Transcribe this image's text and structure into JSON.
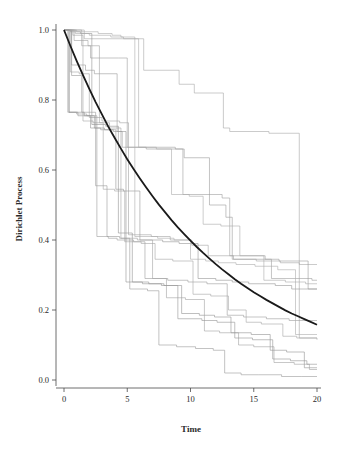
{
  "chart_data": {
    "type": "line",
    "title": "",
    "subtitle": "",
    "xlabel": "Time",
    "ylabel": "Dirichlet Process",
    "xlim": [
      0,
      20
    ],
    "ylim": [
      0.0,
      1.0
    ],
    "xticks": [
      0,
      5,
      10,
      15,
      20
    ],
    "xticklabels": [
      "0",
      "5",
      "10",
      "15",
      "20"
    ],
    "yticks": [
      0.0,
      0.2,
      0.4,
      0.6,
      0.8,
      1.0
    ],
    "yticklabels": [
      "0.0",
      "0.2",
      "0.4",
      "0.6",
      "0.8",
      "1.0"
    ],
    "grid": false,
    "legend": "none",
    "baseline_color": "#1a1a1a",
    "path_color": "#9a9a9a",
    "series": [
      {
        "name": "baseline-exponential",
        "kind": "smooth",
        "color": "#1a1a1a",
        "width": 1.8,
        "x": [
          0,
          0.5,
          1,
          1.5,
          2,
          2.5,
          3,
          3.5,
          4,
          4.5,
          5,
          5.5,
          6,
          6.5,
          7,
          7.5,
          8,
          8.5,
          9,
          9.5,
          10,
          10.5,
          11,
          11.5,
          12,
          12.5,
          13,
          13.5,
          14,
          14.5,
          15,
          15.5,
          16,
          16.5,
          17,
          17.5,
          18,
          18.5,
          19,
          19.5,
          20
        ],
        "values": [
          1.0,
          0.955,
          0.912,
          0.871,
          0.832,
          0.794,
          0.759,
          0.724,
          0.692,
          0.661,
          0.631,
          0.603,
          0.576,
          0.55,
          0.525,
          0.501,
          0.479,
          0.457,
          0.436,
          0.417,
          0.398,
          0.38,
          0.363,
          0.347,
          0.331,
          0.316,
          0.302,
          0.288,
          0.275,
          0.263,
          0.251,
          0.24,
          0.229,
          0.219,
          0.209,
          0.199,
          0.19,
          0.182,
          0.174,
          0.166,
          0.158
        ]
      },
      {
        "name": "path-1",
        "kind": "step",
        "color": "#a8a8a8",
        "x": [
          0,
          0.9,
          1.6,
          4.6,
          6.3,
          9.1,
          10.3,
          12.6,
          13.1,
          16.2,
          18.6,
          20
        ],
        "values": [
          1.0,
          1.0,
          0.975,
          0.975,
          0.885,
          0.845,
          0.82,
          0.72,
          0.71,
          0.705,
          0.33,
          0.33
        ]
      },
      {
        "name": "path-2",
        "kind": "step",
        "color": "#a0a0a0",
        "x": [
          0,
          1.4,
          2.1,
          4.3,
          5.0,
          8.8,
          9.4,
          12.5,
          13.1,
          15.9,
          16.4,
          19.6,
          20
        ],
        "values": [
          1.0,
          0.955,
          0.92,
          0.92,
          0.665,
          0.66,
          0.53,
          0.52,
          0.355,
          0.345,
          0.29,
          0.285,
          0.285
        ]
      },
      {
        "name": "path-3",
        "kind": "step",
        "color": "#9c9c9c",
        "x": [
          0,
          0.6,
          1.7,
          2.4,
          4.2,
          4.6,
          6.5,
          9.5,
          11.5,
          12.8,
          13.3,
          17.0,
          19.3,
          20
        ],
        "values": [
          1.0,
          0.9,
          0.885,
          0.875,
          0.71,
          0.665,
          0.66,
          0.635,
          0.5,
          0.465,
          0.345,
          0.34,
          0.26,
          0.26
        ]
      },
      {
        "name": "path-4",
        "kind": "step",
        "color": "#a4a4a4",
        "x": [
          0,
          0.5,
          1.2,
          2.0,
          3.0,
          4.4,
          5.1,
          6.9,
          8.4,
          10.1,
          11.4,
          13.4,
          15.2,
          17.1,
          18.6,
          20
        ],
        "values": [
          1.0,
          0.88,
          0.875,
          0.75,
          0.74,
          0.735,
          0.415,
          0.41,
          0.4,
          0.385,
          0.355,
          0.345,
          0.34,
          0.335,
          0.12,
          0.115
        ]
      },
      {
        "name": "path-5",
        "kind": "step",
        "color": "#979797",
        "x": [
          0,
          0.4,
          1.1,
          2.1,
          2.9,
          4.1,
          4.7,
          6.0,
          7.8,
          9.1,
          10.6,
          12.0,
          13.3,
          14.6,
          16.7,
          18.0,
          20
        ],
        "values": [
          1.0,
          0.765,
          0.755,
          0.72,
          0.715,
          0.545,
          0.54,
          0.4,
          0.395,
          0.39,
          0.29,
          0.285,
          0.28,
          0.275,
          0.27,
          0.26,
          0.26
        ]
      },
      {
        "name": "path-6",
        "kind": "step",
        "color": "#9e9e9e",
        "x": [
          0,
          0.3,
          1.0,
          1.8,
          2.6,
          3.5,
          4.2,
          5.5,
          6.4,
          8.2,
          9.8,
          11.3,
          12.9,
          14.2,
          16.0,
          17.8,
          20
        ],
        "values": [
          1.0,
          0.765,
          0.76,
          0.755,
          0.41,
          0.405,
          0.4,
          0.395,
          0.29,
          0.285,
          0.28,
          0.275,
          0.185,
          0.18,
          0.175,
          0.17,
          0.17
        ]
      },
      {
        "name": "path-7",
        "kind": "step",
        "color": "#a6a6a6",
        "x": [
          0,
          0.7,
          1.5,
          2.3,
          3.1,
          4.0,
          4.8,
          6.1,
          7.2,
          8.6,
          10.2,
          11.6,
          13.0,
          14.4,
          15.6,
          17.3,
          18.4,
          20
        ],
        "values": [
          1.0,
          0.985,
          0.74,
          0.735,
          0.545,
          0.54,
          0.395,
          0.39,
          0.345,
          0.34,
          0.245,
          0.24,
          0.2,
          0.165,
          0.16,
          0.125,
          0.12,
          0.12
        ]
      },
      {
        "name": "path-8",
        "kind": "step",
        "color": "#939393",
        "x": [
          0,
          0.5,
          1.3,
          2.2,
          3.3,
          4.3,
          5.4,
          6.7,
          7.9,
          9.3,
          10.7,
          11.9,
          13.2,
          14.8,
          16.3,
          17.6,
          19.0,
          20
        ],
        "values": [
          1.0,
          0.995,
          0.99,
          0.73,
          0.725,
          0.42,
          0.28,
          0.275,
          0.27,
          0.19,
          0.185,
          0.18,
          0.135,
          0.13,
          0.085,
          0.08,
          0.035,
          0.035
        ]
      },
      {
        "name": "path-9",
        "kind": "step",
        "color": "#a2a2a2",
        "x": [
          0,
          0.8,
          1.9,
          2.8,
          3.6,
          4.5,
          5.8,
          7.0,
          8.1,
          9.6,
          11.1,
          12.3,
          13.8,
          15.0,
          16.6,
          18.2,
          19.4,
          20
        ],
        "values": [
          1.0,
          0.97,
          0.955,
          0.735,
          0.72,
          0.405,
          0.4,
          0.29,
          0.235,
          0.23,
          0.14,
          0.135,
          0.1,
          0.095,
          0.05,
          0.045,
          0.03,
          0.03
        ]
      },
      {
        "name": "path-10",
        "kind": "step",
        "color": "#9a9a9a",
        "x": [
          0,
          0.6,
          1.4,
          2.5,
          3.4,
          4.4,
          5.2,
          6.6,
          7.5,
          8.9,
          10.4,
          11.8,
          12.7,
          14.0,
          15.4,
          17.2,
          18.8,
          20
        ],
        "values": [
          1.0,
          0.87,
          0.765,
          0.555,
          0.41,
          0.405,
          0.26,
          0.255,
          0.1,
          0.095,
          0.09,
          0.085,
          0.02,
          0.015,
          0.015,
          0.01,
          0.01,
          0.01
        ]
      },
      {
        "name": "path-11",
        "kind": "step",
        "color": "#adadad",
        "x": [
          0,
          1.0,
          2.7,
          3.8,
          4.5,
          5.6,
          7.4,
          8.7,
          10.0,
          11.2,
          12.2,
          13.6,
          15.1,
          16.9,
          18.3,
          20
        ],
        "values": [
          1.0,
          0.995,
          0.99,
          0.985,
          0.98,
          0.41,
          0.405,
          0.4,
          0.345,
          0.34,
          0.335,
          0.33,
          0.325,
          0.315,
          0.13,
          0.13
        ]
      },
      {
        "name": "path-12",
        "kind": "step",
        "color": "#959595",
        "x": [
          0,
          0.4,
          1.6,
          2.4,
          3.2,
          3.9,
          4.9,
          6.2,
          7.7,
          9.0,
          10.9,
          12.1,
          13.5,
          14.9,
          16.5,
          17.9,
          19.2,
          20
        ],
        "values": [
          1.0,
          0.765,
          0.755,
          0.72,
          0.715,
          0.71,
          0.28,
          0.275,
          0.27,
          0.175,
          0.17,
          0.165,
          0.12,
          0.115,
          0.06,
          0.055,
          0.045,
          0.045
        ]
      },
      {
        "name": "path-13",
        "kind": "step",
        "color": "#abab ab",
        "x": [
          0,
          0.9,
          2.0,
          3.7,
          4.7,
          5.9,
          7.3,
          8.5,
          9.9,
          11.0,
          12.4,
          13.9,
          15.8,
          17.5,
          19.1,
          20
        ],
        "values": [
          1.0,
          0.99,
          0.985,
          0.98,
          0.975,
          0.665,
          0.66,
          0.53,
          0.525,
          0.445,
          0.44,
          0.355,
          0.285,
          0.28,
          0.275,
          0.275
        ]
      }
    ]
  },
  "axes": {
    "x_tick_len": 4,
    "y_tick_len": 4
  }
}
